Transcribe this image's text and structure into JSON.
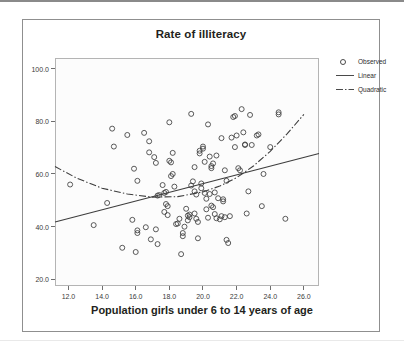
{
  "figure": {
    "title": "Rate of illiteracy",
    "xaxis_title": "Population girls under 6 to 14 years of age"
  },
  "legend": {
    "position": "right",
    "items": [
      {
        "label": "Observed",
        "key": "circle-marker"
      },
      {
        "label": "Linear",
        "key": "solid-line"
      },
      {
        "label": "Quadratic",
        "key": "dash-dot-line"
      }
    ]
  },
  "axes": {
    "y_ticks": [
      "20.0",
      "40.0",
      "60.0",
      "80.0",
      "100.0"
    ],
    "x_ticks": [
      "12.0",
      "14.0",
      "16.0",
      "18.0",
      "20.0",
      "22.0",
      "24.0",
      "26.0"
    ]
  },
  "chart_data": {
    "type": "scatter",
    "title": "Rate of illiteracy",
    "xlabel": "Population girls under 6 to 14 years of age",
    "ylabel": "",
    "xlim": [
      11.2,
      26.9
    ],
    "ylim": [
      17.5,
      104.0
    ],
    "grid": false,
    "legend_position": "right",
    "xticks": [
      12.0,
      14.0,
      16.0,
      18.0,
      20.0,
      22.0,
      24.0,
      26.0
    ],
    "yticks": [
      20.0,
      40.0,
      60.0,
      80.0,
      100.0
    ],
    "series": [
      {
        "name": "Observed",
        "type": "scatter",
        "marker": "open-circle",
        "points": [
          [
            12.1,
            56.0
          ],
          [
            13.5,
            40.6
          ],
          [
            14.3,
            49.0
          ],
          [
            14.6,
            77.2
          ],
          [
            14.7,
            70.4
          ],
          [
            15.2,
            32.0
          ],
          [
            15.5,
            74.8
          ],
          [
            15.8,
            42.6
          ],
          [
            15.9,
            62.0
          ],
          [
            16.0,
            30.4
          ],
          [
            16.1,
            57.4
          ],
          [
            16.1,
            38.6
          ],
          [
            16.1,
            37.6
          ],
          [
            16.5,
            75.6
          ],
          [
            16.6,
            39.8
          ],
          [
            16.8,
            68.2
          ],
          [
            16.8,
            72.4
          ],
          [
            16.9,
            35.2
          ],
          [
            17.1,
            66.4
          ],
          [
            17.2,
            64.2
          ],
          [
            17.2,
            39.0
          ],
          [
            17.3,
            51.8
          ],
          [
            17.3,
            33.4
          ],
          [
            17.4,
            52.0
          ],
          [
            17.6,
            55.8
          ],
          [
            17.7,
            45.6
          ],
          [
            17.7,
            52.8
          ],
          [
            17.8,
            53.2
          ],
          [
            17.8,
            48.6
          ],
          [
            17.9,
            47.8
          ],
          [
            17.9,
            44.4
          ],
          [
            18.0,
            79.6
          ],
          [
            18.0,
            65.0
          ],
          [
            18.1,
            64.4
          ],
          [
            18.1,
            59.2
          ],
          [
            18.2,
            68.0
          ],
          [
            18.2,
            60.0
          ],
          [
            18.3,
            55.2
          ],
          [
            18.4,
            41.0
          ],
          [
            18.5,
            41.2
          ],
          [
            18.6,
            43.0
          ],
          [
            18.7,
            29.6
          ],
          [
            18.8,
            37.6
          ],
          [
            18.8,
            36.4
          ],
          [
            18.9,
            40.0
          ],
          [
            19.0,
            46.8
          ],
          [
            19.1,
            44.2
          ],
          [
            19.1,
            42.4
          ],
          [
            19.2,
            44.6
          ],
          [
            19.2,
            43.6
          ],
          [
            19.3,
            82.8
          ],
          [
            19.3,
            55.6
          ],
          [
            19.4,
            57.2
          ],
          [
            19.5,
            62.6
          ],
          [
            19.5,
            53.4
          ],
          [
            19.5,
            45.0
          ],
          [
            19.6,
            52.2
          ],
          [
            19.6,
            43.0
          ],
          [
            19.7,
            41.8
          ],
          [
            19.7,
            35.6
          ],
          [
            19.8,
            68.8
          ],
          [
            19.8,
            67.8
          ],
          [
            19.9,
            56.4
          ],
          [
            19.9,
            54.6
          ],
          [
            20.0,
            70.4
          ],
          [
            20.0,
            69.6
          ],
          [
            20.1,
            64.6
          ],
          [
            20.1,
            52.8
          ],
          [
            20.2,
            50.6
          ],
          [
            20.2,
            46.6
          ],
          [
            20.3,
            78.8
          ],
          [
            20.3,
            43.4
          ],
          [
            20.4,
            66.6
          ],
          [
            20.4,
            52.4
          ],
          [
            20.5,
            63.0
          ],
          [
            20.5,
            62.2
          ],
          [
            20.5,
            48.0
          ],
          [
            20.6,
            64.0
          ],
          [
            20.6,
            47.4
          ],
          [
            20.7,
            53.0
          ],
          [
            20.7,
            44.8
          ],
          [
            20.8,
            67.0
          ],
          [
            20.8,
            43.2
          ],
          [
            20.9,
            50.8
          ],
          [
            21.0,
            42.8
          ],
          [
            21.1,
            73.6
          ],
          [
            21.1,
            44.0
          ],
          [
            21.2,
            50.4
          ],
          [
            21.2,
            49.6
          ],
          [
            21.3,
            61.4
          ],
          [
            21.3,
            43.6
          ],
          [
            21.4,
            57.4
          ],
          [
            21.4,
            35.0
          ],
          [
            21.5,
            33.8
          ],
          [
            21.6,
            44.0
          ],
          [
            21.7,
            73.8
          ],
          [
            21.8,
            81.6
          ],
          [
            21.9,
            82.0
          ],
          [
            21.9,
            70.2
          ],
          [
            22.0,
            74.6
          ],
          [
            22.1,
            62.2
          ],
          [
            22.2,
            61.4
          ],
          [
            22.3,
            84.6
          ],
          [
            22.4,
            75.8
          ],
          [
            22.5,
            71.2
          ],
          [
            22.5,
            71.0
          ],
          [
            22.6,
            45.0
          ],
          [
            22.7,
            53.4
          ],
          [
            22.8,
            82.4
          ],
          [
            22.9,
            71.0
          ],
          [
            23.2,
            74.6
          ],
          [
            23.3,
            75.0
          ],
          [
            23.5,
            47.8
          ],
          [
            23.6,
            60.0
          ],
          [
            24.0,
            70.2
          ],
          [
            24.5,
            83.4
          ],
          [
            24.5,
            82.6
          ],
          [
            24.9,
            43.0
          ]
        ]
      },
      {
        "name": "Linear",
        "type": "line",
        "style": "solid",
        "endpoints": [
          [
            11.2,
            41.8
          ],
          [
            26.9,
            67.8
          ]
        ]
      },
      {
        "name": "Quadratic",
        "type": "line",
        "style": "dash-dot",
        "points": [
          [
            11.2,
            62.8
          ],
          [
            12.5,
            58.4
          ],
          [
            14.0,
            54.6
          ],
          [
            15.5,
            52.4
          ],
          [
            17.0,
            51.2
          ],
          [
            18.5,
            51.4
          ],
          [
            20.0,
            53.2
          ],
          [
            21.0,
            55.4
          ],
          [
            22.0,
            58.6
          ],
          [
            23.0,
            63.0
          ],
          [
            24.0,
            68.6
          ],
          [
            25.0,
            75.2
          ],
          [
            26.0,
            82.6
          ]
        ]
      }
    ]
  }
}
